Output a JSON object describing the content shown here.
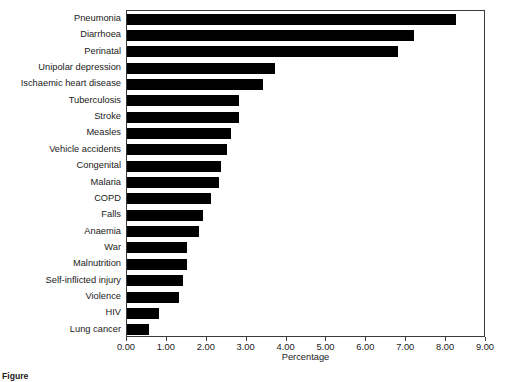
{
  "figure": {
    "background": "#ffffff",
    "bar_color": "#000000",
    "axis_color": "#3a3a3a"
  },
  "axis": {
    "x_title": "Percentage",
    "x_ticks": [
      "0.00",
      "1.00",
      "2.00",
      "3.00",
      "4.00",
      "5.00",
      "6.00",
      "7.00",
      "8.00",
      "9.00"
    ]
  },
  "caption": {
    "label": "Figure",
    "text": ""
  },
  "chart_data": {
    "type": "bar",
    "orientation": "horizontal",
    "title": "",
    "xlabel": "Percentage",
    "ylabel": "",
    "xlim": [
      0,
      9
    ],
    "grid": false,
    "legend": "none",
    "categories": [
      "Pneumonia",
      "Diarrhoea",
      "Perinatal",
      "Unipolar depression",
      "Ischaemic heart disease",
      "Tuberculosis",
      "Stroke",
      "Measles",
      "Vehicle accidents",
      "Congenital",
      "Malaria",
      "COPD",
      "Falls",
      "Anaemia",
      "War",
      "Malnutrition",
      "Self-inflicted injury",
      "Violence",
      "HIV",
      "Lung cancer"
    ],
    "values": [
      8.25,
      7.2,
      6.8,
      3.7,
      3.4,
      2.8,
      2.8,
      2.6,
      2.5,
      2.35,
      2.3,
      2.1,
      1.9,
      1.8,
      1.5,
      1.5,
      1.4,
      1.3,
      0.8,
      0.55
    ],
    "tick_values": [
      0,
      1,
      2,
      3,
      4,
      5,
      6,
      7,
      8,
      9
    ]
  }
}
